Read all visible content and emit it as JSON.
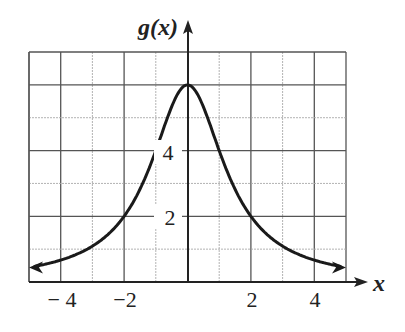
{
  "chart_data": {
    "type": "line",
    "title": "",
    "xlabel": "x",
    "ylabel": "g(x)",
    "xlim": [
      -5,
      5
    ],
    "ylim": [
      0,
      7
    ],
    "grid": true,
    "x_ticks": [
      -4,
      -2,
      2,
      4
    ],
    "x_tick_labels": [
      "− 4",
      "−2",
      "2",
      "4"
    ],
    "y_ticks": [
      2,
      4
    ],
    "y_tick_labels": [
      "2",
      "4"
    ],
    "series": [
      {
        "name": "g(x)",
        "x": [
          -5,
          -4,
          -3,
          -2,
          -1,
          0,
          1,
          2,
          3,
          4,
          5
        ],
        "values": [
          0.44,
          0.67,
          1.09,
          2.0,
          4.0,
          6.0,
          4.0,
          2.0,
          1.09,
          0.67,
          0.44
        ],
        "ends_with_arrows": true
      }
    ],
    "legend": "none"
  },
  "labels": {
    "y_axis": "g(x)",
    "x_axis": "x",
    "tick_x_neg4": "− 4",
    "tick_x_neg2": "−2",
    "tick_x_2": "2",
    "tick_x_4": "4",
    "tick_y_2": "2",
    "tick_y_4": "4"
  }
}
